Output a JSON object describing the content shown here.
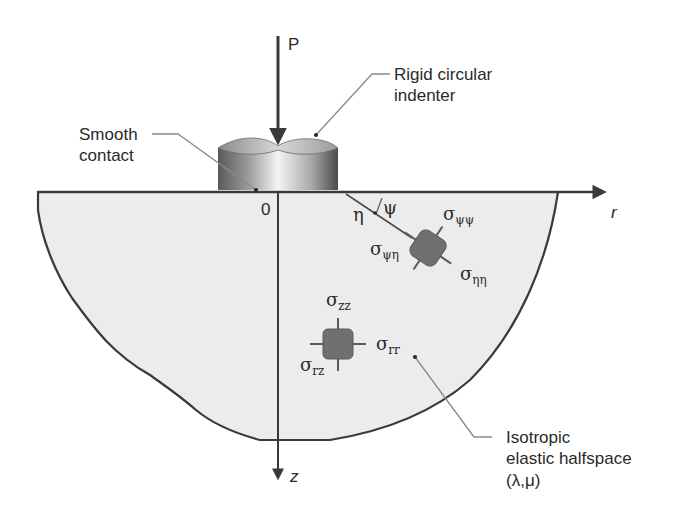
{
  "diagram": {
    "type": "contact-mechanics-schematic",
    "colors": {
      "background": "#ffffff",
      "halfspace_fill": "#ececec",
      "outline": "#3a3a3a",
      "leader_line": "#8a8a8a",
      "element_fill": "#707070",
      "text": "#2a2a2a"
    },
    "load": {
      "label": "P"
    },
    "indenter": {
      "label_line1": "Rigid circular",
      "label_line2": "indenter"
    },
    "contact": {
      "label_line1": "Smooth",
      "label_line2": "contact"
    },
    "axes": {
      "origin_label": "0",
      "r_label": "r",
      "z_label": "z"
    },
    "rotated_frame": {
      "eta_label": "η",
      "psi_label": "ψ"
    },
    "element_rotated": {
      "stresses": [
        {
          "symbol": "σ",
          "subscript": "ψψ"
        },
        {
          "symbol": "σ",
          "subscript": "ψη"
        },
        {
          "symbol": "σ",
          "subscript": "ηη"
        }
      ]
    },
    "element_cylindrical": {
      "stresses": [
        {
          "symbol": "σ",
          "subscript": "zz"
        },
        {
          "symbol": "σ",
          "subscript": "rr"
        },
        {
          "symbol": "σ",
          "subscript": "rz"
        }
      ]
    },
    "halfspace": {
      "label_line1": "Isotropic",
      "label_line2": "elastic halfspace",
      "label_line3": "(λ,μ)"
    }
  }
}
